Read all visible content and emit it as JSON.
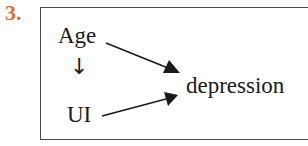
{
  "item_number": "3.",
  "colors": {
    "item_number": "#d9703c",
    "text": "#1a1a1a",
    "border": "#4a4a4a"
  },
  "diagram": {
    "nodes": [
      {
        "id": "age",
        "label": "Age"
      },
      {
        "id": "ui",
        "label": "UI"
      },
      {
        "id": "depression",
        "label": "depression"
      }
    ],
    "edges": [
      {
        "from": "age",
        "to": "ui",
        "style": "down-arrow-glyph",
        "glyph": "↓"
      },
      {
        "from": "age",
        "to": "depression",
        "style": "solid-arrow"
      },
      {
        "from": "ui",
        "to": "depression",
        "style": "solid-arrow"
      }
    ]
  }
}
